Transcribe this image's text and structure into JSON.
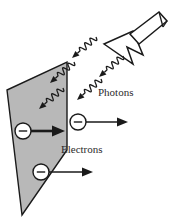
{
  "figure": {
    "background_color": "#ffffff",
    "width": 172,
    "height": 222,
    "labels": {
      "photons": "Photons",
      "electrons": "Electrons"
    },
    "electron_symbol": "−",
    "colors": {
      "plate_fill": "#b8b8b8",
      "plate_stroke": "#1a1a1a",
      "ink": "#1a1a1a",
      "text": "#2b2b2b",
      "lamp_fill": "#ffffff",
      "lamp_stroke": "#1a1a1a"
    },
    "metal_plate": {
      "name": "metal-plate",
      "description": "gray parallelogram metal surface in perspective",
      "points": "22,215 7,90 67,62 67,150"
    },
    "lamp": {
      "name": "light-source",
      "description": "flashlight emitting photons toward the plate",
      "cone_points": "104,44 133,31 143,55 127,47 133,64",
      "handle_points": "130,34 159,12 167,21 139,44"
    },
    "photons": {
      "name": "photon-rays",
      "count": 5,
      "description": "wavy arrows travelling down-left toward the metal plate",
      "rays": [
        {
          "id": "photon-1",
          "x1": 96,
          "y1": 37,
          "x2": 72,
          "y2": 58
        },
        {
          "id": "photon-2",
          "x1": 123,
          "y1": 56,
          "x2": 99,
          "y2": 77
        },
        {
          "id": "photon-3",
          "x1": 74,
          "y1": 62,
          "x2": 50,
          "y2": 83
        },
        {
          "id": "photon-4",
          "x1": 101,
          "y1": 79,
          "x2": 77,
          "y2": 100
        },
        {
          "id": "photon-5",
          "x1": 63,
          "y1": 88,
          "x2": 39,
          "y2": 109
        }
      ]
    },
    "electrons": {
      "name": "electron-particles",
      "count": 3,
      "description": "circles carrying a minus sign with arrows pointing right",
      "items": [
        {
          "id": "electron-1",
          "cx": 23,
          "cy": 131,
          "r": 8,
          "arrow_x1": 31,
          "arrow_y1": 131,
          "arrow_x2": 65,
          "arrow_y2": 131,
          "thick": true
        },
        {
          "id": "electron-2",
          "cx": 78,
          "cy": 122,
          "r": 8,
          "arrow_x1": 86,
          "arrow_y1": 122,
          "arrow_x2": 128,
          "arrow_y2": 122,
          "thick": false
        },
        {
          "id": "electron-3",
          "cx": 41,
          "cy": 172,
          "r": 8,
          "arrow_x1": 49,
          "arrow_y1": 172,
          "arrow_x2": 93,
          "arrow_y2": 172,
          "thick": false
        }
      ]
    },
    "label_positions": {
      "photons": {
        "x": 98,
        "y": 96
      },
      "electrons": {
        "x": 61,
        "y": 153
      }
    }
  }
}
